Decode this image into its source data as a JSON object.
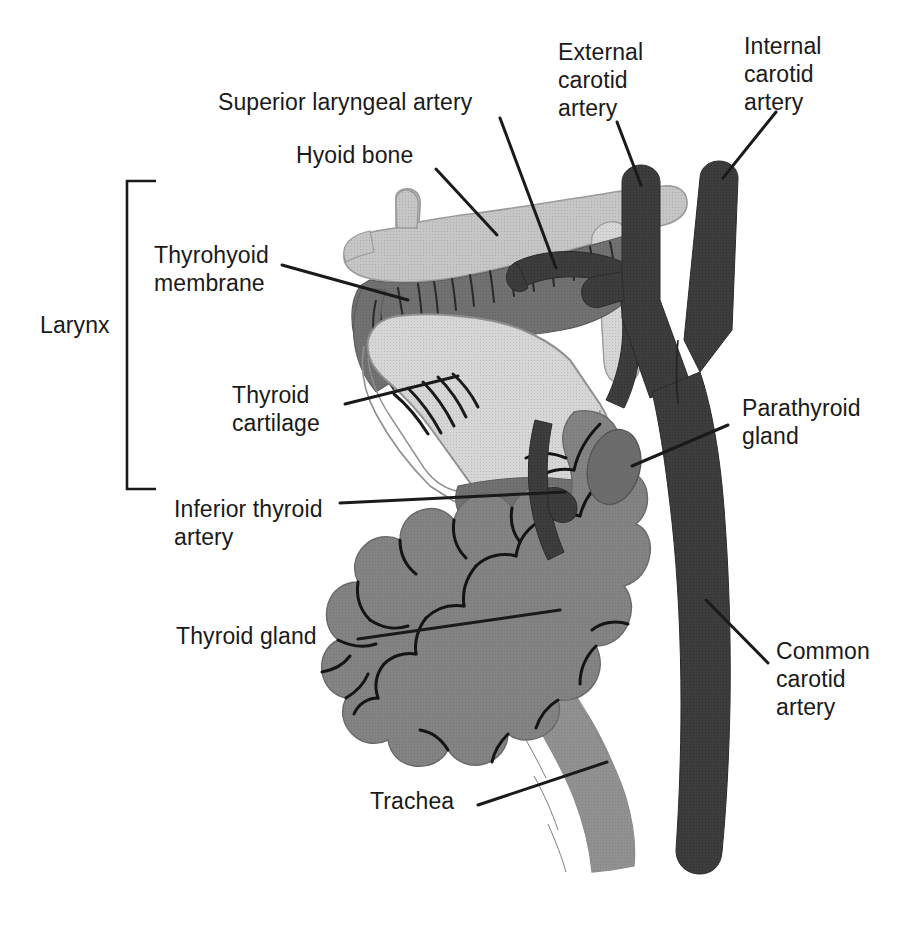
{
  "figure": {
    "width": 920,
    "height": 933,
    "background": "#ffffff"
  },
  "palette": {
    "line": "#1a1a1a",
    "cartilage_light": "#d2d2d2",
    "hyoid_bone": "#c3c3c3",
    "thyrohyoid_membrane": "#6e6e6e",
    "thyroid_gland": "#808080",
    "parathyroid_gland": "#6b6b6b",
    "trachea": "#8e8e8e",
    "artery_dark": "#3a3a3a",
    "artery_mid": "#5a5a5a",
    "text": "#1a1a1a"
  },
  "bracket": {
    "label": "Larynx",
    "x": 126,
    "y_top": 180,
    "y_bottom": 490
  },
  "labels": [
    {
      "id": "superior-laryngeal-artery",
      "text": "Superior laryngeal artery",
      "x": 218,
      "y": 88,
      "align": "left",
      "leader": {
        "x1": 500,
        "y1": 118,
        "x2": 556,
        "y2": 268
      }
    },
    {
      "id": "hyoid-bone",
      "text": "Hyoid bone",
      "x": 296,
      "y": 141,
      "align": "left",
      "leader": {
        "x1": 436,
        "y1": 169,
        "x2": 497,
        "y2": 235
      }
    },
    {
      "id": "external-carotid-artery",
      "text": "External\ncarotid\nartery",
      "x": 558,
      "y": 38,
      "align": "left",
      "leader": {
        "x1": 617,
        "y1": 122,
        "x2": 641,
        "y2": 185
      }
    },
    {
      "id": "internal-carotid-artery",
      "text": "Internal\ncarotid\nartery",
      "x": 744,
      "y": 32,
      "align": "left",
      "leader": {
        "x1": 776,
        "y1": 112,
        "x2": 723,
        "y2": 178
      }
    },
    {
      "id": "thyrohyoid-membrane",
      "text": "Thyrohyoid\nmembrane",
      "x": 154,
      "y": 241,
      "align": "left",
      "leader": {
        "x1": 282,
        "y1": 265,
        "x2": 408,
        "y2": 300
      }
    },
    {
      "id": "thyroid-cartilage",
      "text": "Thyroid\ncartilage",
      "x": 232,
      "y": 381,
      "align": "left",
      "leader": {
        "x1": 345,
        "y1": 404,
        "x2": 458,
        "y2": 376
      }
    },
    {
      "id": "inferior-thyroid-artery",
      "text": "Inferior thyroid\nartery",
      "x": 174,
      "y": 495,
      "align": "left",
      "leader": {
        "x1": 340,
        "y1": 503,
        "x2": 565,
        "y2": 492
      }
    },
    {
      "id": "parathyroid-gland",
      "text": "Parathyroid\ngland",
      "x": 742,
      "y": 394,
      "align": "left",
      "leader": {
        "x1": 728,
        "y1": 425,
        "x2": 632,
        "y2": 466
      }
    },
    {
      "id": "thyroid-gland",
      "text": "Thyroid gland",
      "x": 176,
      "y": 622,
      "align": "left",
      "leader": {
        "x1": 358,
        "y1": 639,
        "x2": 560,
        "y2": 610
      }
    },
    {
      "id": "common-carotid-artery",
      "text": "Common\ncarotid\nartery",
      "x": 776,
      "y": 637,
      "align": "left",
      "leader": {
        "x1": 768,
        "y1": 663,
        "x2": 706,
        "y2": 600
      }
    },
    {
      "id": "trachea",
      "text": "Trachea",
      "x": 370,
      "y": 787,
      "align": "left",
      "leader": {
        "x1": 478,
        "y1": 805,
        "x2": 607,
        "y2": 762
      }
    }
  ]
}
